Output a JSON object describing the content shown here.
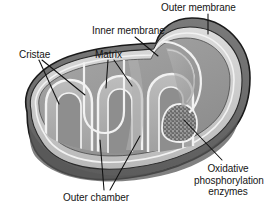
{
  "figure": {
    "style": "grayscale cut-away anatomical illustration",
    "width": 267,
    "height": 211,
    "background_color": "#ffffff"
  },
  "labels": {
    "outer_membrane": "Outer membrane",
    "inner_membrane": "Inner membrane",
    "cristae": "Cristae",
    "matrix": "Matrix",
    "outer_chamber": "Outer chamber",
    "oxidative_line1": "Oxidative",
    "oxidative_line2": "phosphorylation",
    "oxidative_line3": "enzymes"
  },
  "colors": {
    "outer_membrane_dark": "#6f6f6f",
    "outer_membrane_shadow": "#5f5f5f",
    "outer_membrane_rim": "#7d7d7d",
    "intermembrane_light": "#d8d8d8",
    "matrix_mid": "#9a9a9a",
    "matrix_light": "#b4b4b4",
    "crista_fill": "#8c8c8c",
    "membrane_line_white": "#f2f2f2",
    "outline_black": "#1a1a1a",
    "leader_line": "#111111",
    "text": "#141414",
    "enzyme_stipple": "#4a4a4a"
  },
  "parts": [
    {
      "name": "outer-membrane",
      "description": "dark gray outermost bounding membrane of the organelle"
    },
    {
      "name": "inner-membrane",
      "description": "white double-line membrane folded into cristae"
    },
    {
      "name": "cristae",
      "description": "finger-like infoldings of the inner membrane projecting into the matrix"
    },
    {
      "name": "matrix",
      "description": "gray interior space enclosed by the inner membrane"
    },
    {
      "name": "outer-chamber",
      "description": "intermembrane space between outer and inner membranes"
    },
    {
      "name": "oxidative-phosphorylation-enzymes",
      "description": "stippled particles studding a crista membrane"
    }
  ]
}
